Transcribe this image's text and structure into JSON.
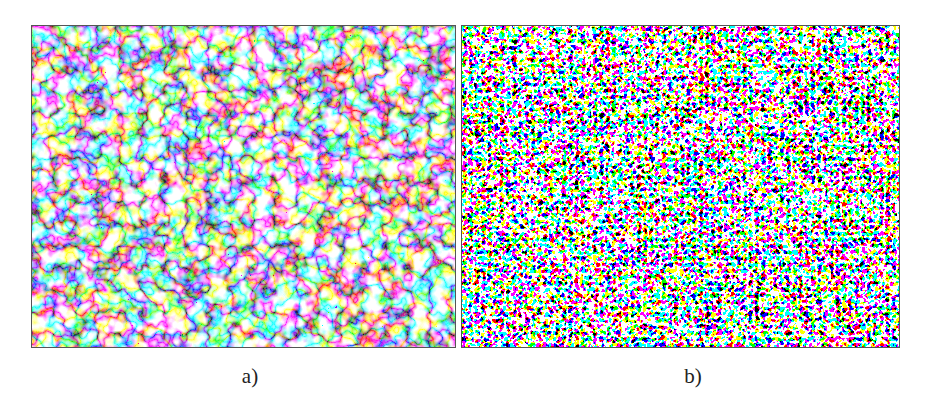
{
  "figure": {
    "panels": [
      {
        "id": "a",
        "label": "a)",
        "description": "Micrograph with coarse network of dark boundary lines and scattered dark particles on light background"
      },
      {
        "id": "b",
        "label": "b)",
        "description": "Micrograph with fine, dense labyrinthine dark/light pattern"
      }
    ]
  },
  "colors": {
    "background": "#ffffff",
    "ink": "#111111",
    "border": "#555555"
  }
}
